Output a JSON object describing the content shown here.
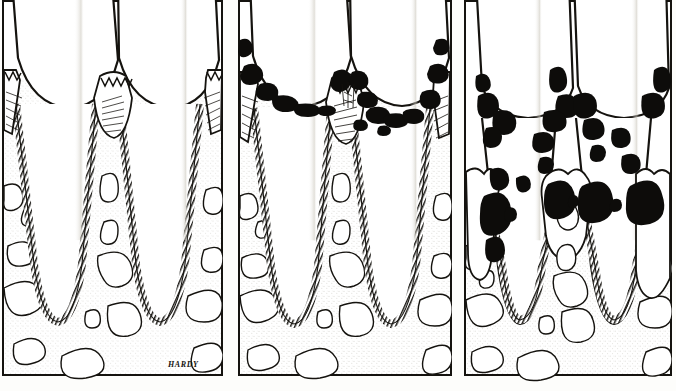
{
  "figure": {
    "kind": "dental-illustration",
    "style": "pen-and-ink line drawing, black on white",
    "background_color": "#fdfdfb",
    "ink_color": "#15130f",
    "stipple_color": "#9a978c",
    "calculus_color": "#0d0c0a",
    "panel_count": 3,
    "signature": "HARDY",
    "caption_partial": ""
  },
  "panels": [
    {
      "index": 1,
      "name": "healthy-periodontium",
      "label": "",
      "stage": "Normal / healthy gingiva and alveolar bone",
      "features": [
        "two mandibular incisor crowns with enamel",
        "intact interdental papilla reaching contact point",
        "zigzag junctional epithelium at cemento-enamel junction",
        "alveolar crest at normal height near CEJ",
        "continuous periodontal ligament space (hatched band)",
        "trabecular marrow spaces stippled"
      ],
      "calculus": "none",
      "bone_level": "normal",
      "x": 2,
      "w": 221
    },
    {
      "index": 2,
      "name": "gingivitis-early-periodontitis",
      "label": "",
      "stage": "Calculus accumulation with gingival inflammation",
      "features": [
        "black subgingival and supragingival calculus along gingival margin",
        "swollen rolled gingival margins",
        "interdental papilla blunted",
        "alveolar crest still near normal height",
        "periodontal ligament intact"
      ],
      "calculus": "moderate, at gingival margin",
      "bone_level": "slight crestal change",
      "x": 238,
      "w": 214
    },
    {
      "index": 3,
      "name": "advanced-periodontitis",
      "label": "",
      "stage": "Advanced bone loss with deep calculus in pockets",
      "features": [
        "heavy black calculus extending far apically on root surfaces",
        "marked gingival recession exposing root",
        "severe horizontal and vertical alveolar bone loss",
        "deep infrabony pockets between roots",
        "irregular resorbed crestal bone outline"
      ],
      "calculus": "heavy, subgingival into deep pockets",
      "bone_level": "severe loss, roots exposed",
      "x": 464,
      "w": 208
    }
  ],
  "anatomy_legend": [
    {
      "key": "crown",
      "name": "Anatomic crown (enamel)"
    },
    {
      "key": "root",
      "name": "Root (dentin / cementum)"
    },
    {
      "key": "pdl",
      "name": "Periodontal ligament space"
    },
    {
      "key": "bone",
      "name": "Alveolar bone with trabeculae"
    },
    {
      "key": "marrow",
      "name": "Marrow space"
    },
    {
      "key": "gingiva",
      "name": "Gingiva / interdental papilla"
    },
    {
      "key": "calculus",
      "name": "Calculus / plaque deposit"
    }
  ]
}
